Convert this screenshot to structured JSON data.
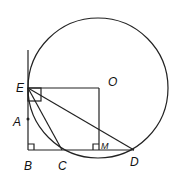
{
  "diagram": {
    "points": {
      "E": {
        "label": "E",
        "x": 28,
        "y": 88
      },
      "A": {
        "label": "A",
        "x": 28,
        "y": 119
      },
      "B": {
        "label": "B",
        "x": 28,
        "y": 150
      },
      "C": {
        "label": "C",
        "x": 62,
        "y": 150
      },
      "M": {
        "label": "M",
        "x": 99,
        "y": 150
      },
      "D": {
        "label": "D",
        "x": 134,
        "y": 150
      },
      "O": {
        "label": "O",
        "x": 113,
        "y": 82
      }
    },
    "circle": {
      "cx": 98,
      "cy": 88,
      "r": 70
    },
    "stroke_color": "#222222"
  }
}
